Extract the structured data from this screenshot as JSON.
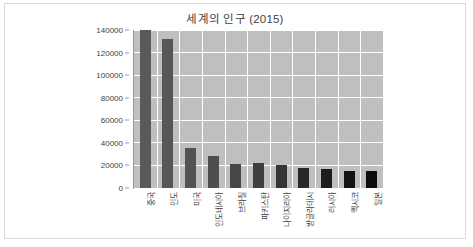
{
  "chart_data": {
    "type": "bar",
    "title": "세계의 인구 (2015)",
    "xlabel": "",
    "ylabel": "",
    "categories": [
      "중국",
      "인도",
      "미국",
      "인도네시아",
      "브라질",
      "파키스탄",
      "나이지리아",
      "방글라데시",
      "러시아",
      "멕시코",
      "일본"
    ],
    "values": [
      140000,
      132000,
      35400,
      28800,
      21500,
      21900,
      20800,
      17800,
      17000,
      14700,
      15100
    ],
    "ylim": [
      0,
      140000
    ],
    "ytick_labels": [
      "0",
      "20000",
      "40000",
      "60000",
      "80000",
      "100000",
      "120000",
      "140000"
    ],
    "ytick_values": [
      0,
      20000,
      40000,
      60000,
      80000,
      100000,
      120000,
      140000
    ],
    "grid": true,
    "legend": false,
    "legend_position": "none",
    "bar_colors": [
      "#595959",
      "#565656",
      "#535353",
      "#4e4e4e",
      "#474747",
      "#3f3f3f",
      "#353535",
      "#282828",
      "#1c1c1c",
      "#131313",
      "#0d0d0d"
    ],
    "plot_background": "#bfbfbf",
    "gridline_color": "#ffffff",
    "text_color": "#3f3f3f",
    "frame_border_color": "#d9d9d9"
  }
}
